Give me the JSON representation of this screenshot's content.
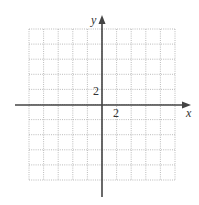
{
  "chart_data": {
    "type": "scatter",
    "title": "",
    "xlabel": "x",
    "ylabel": "y",
    "xlim": [
      -10,
      10
    ],
    "ylim": [
      -10,
      10
    ],
    "grid": true,
    "grid_step": 2,
    "tick_labels": {
      "x": "2",
      "y": "2"
    },
    "series": []
  },
  "axes": {
    "x_label": "x",
    "y_label": "y",
    "x_tick": "2",
    "y_tick": "2"
  }
}
